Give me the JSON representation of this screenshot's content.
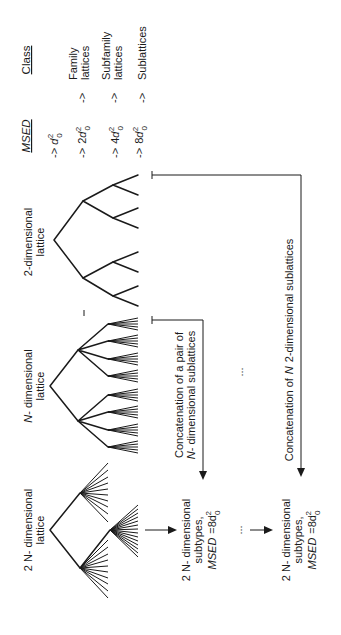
{
  "figure": {
    "orientation": "rotated-90-ccw",
    "headers": {
      "msed": "MSED",
      "class": "Class"
    },
    "msed_levels": [
      {
        "arrow": "->",
        "coef": "",
        "var": "d",
        "sub": "0",
        "sup": "2"
      },
      {
        "arrow": "->",
        "coef": "2",
        "var": "d",
        "sub": "0",
        "sup": "2"
      },
      {
        "arrow": "->",
        "coef": "4",
        "var": "d",
        "sub": "0",
        "sup": "2"
      },
      {
        "arrow": "->",
        "coef": "8",
        "var": "d",
        "sub": "0",
        "sup": "2"
      }
    ],
    "classes": [
      {
        "arrow": "->",
        "line1": "Family",
        "line2": "lattices"
      },
      {
        "arrow": "->",
        "line1": "Subfamily",
        "line2": "lattices"
      },
      {
        "arrow": "->",
        "line1": "Sublattices",
        "line2": ""
      }
    ],
    "lattices": [
      {
        "prefix": "",
        "line1": "2-dimensional",
        "line2": "lattice"
      },
      {
        "prefix": "N",
        "line1": "- dimensional",
        "line2": "lattice"
      },
      {
        "prefix": "2 N",
        "line1": "- dimensional",
        "line2": "lattice"
      }
    ],
    "concatenations": [
      {
        "line1": "Concatenation of a pair of",
        "line2_prefix": "N",
        "line2": "- dimensional sublattices"
      },
      {
        "line1_a": "Concatenation of",
        "line1_n": "N",
        "line1_b": "2-dimensional sublattices"
      }
    ],
    "subtypes": [
      {
        "line1_prefix": "2 N",
        "line1": "- dimensional",
        "line2": "subtypes,",
        "msed_label": "MSED",
        "msed_value": "=8d",
        "sub": "0",
        "sup": "2"
      },
      {
        "line1_prefix": "2 N",
        "line1": "- dimensional",
        "line2": "subtypes,",
        "msed_label": "MSED",
        "msed_value": "=8d",
        "sub": "0",
        "sup": "2"
      }
    ],
    "ellipsis": ":",
    "ellipsis_dots": "..."
  }
}
